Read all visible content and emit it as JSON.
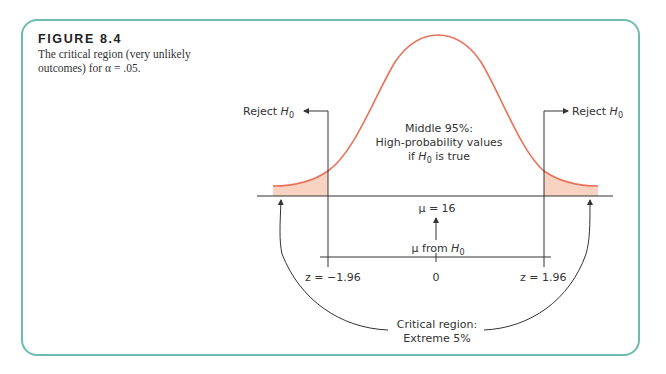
{
  "figure": {
    "title": "FIGURE 8.4",
    "caption_line1": "The critical region (very unlikely",
    "caption_line2": "outcomes) for α = .05."
  },
  "diagram": {
    "reject_left": "Reject ",
    "reject_right": "Reject ",
    "h0_symbol": "H",
    "h0_sub": "0",
    "middle_line1": "Middle 95%:",
    "middle_line2": "High-probability values",
    "middle_line3_pre": "if ",
    "middle_line3_post": " is true",
    "mu_label": "μ = 16",
    "mu_from_pre": "μ from ",
    "z_left": "z = −1.96",
    "z_center": "0",
    "z_right": "z = 1.96",
    "critical_line1": "Critical region:",
    "critical_line2": "Extreme 5%"
  },
  "colors": {
    "frame": "#6dbcb0",
    "curve": "#e8735a",
    "tail_fill": "#f9d3c2",
    "line": "#333333"
  }
}
